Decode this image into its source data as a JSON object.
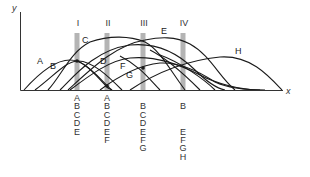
{
  "axes": {
    "y_label": "y",
    "x_label": "x"
  },
  "colors": {
    "curve": "#1a1a1a",
    "bar": "#b4b4b4",
    "axis": "#333333"
  },
  "sections": [
    {
      "label": "I",
      "x": 77,
      "species": [
        "A",
        "B",
        "C",
        "D",
        "E"
      ]
    },
    {
      "label": "II",
      "x": 107,
      "species": [
        "A",
        "B",
        "C",
        "D",
        "E",
        "F"
      ]
    },
    {
      "label": "III",
      "x": 143,
      "species": [
        "",
        "B",
        "C",
        "D",
        "E",
        "F",
        "G"
      ]
    },
    {
      "label": "IV",
      "x": 183,
      "species": [
        "",
        "B",
        "",
        "",
        "E",
        "F",
        "G",
        "H"
      ]
    }
  ],
  "curve_labels": [
    {
      "text": "A",
      "x": 38,
      "y": 57
    },
    {
      "text": "B",
      "x": 51,
      "y": 61
    },
    {
      "text": "C",
      "x": 82,
      "y": 36
    },
    {
      "text": "D",
      "x": 100,
      "y": 58
    },
    {
      "text": "E",
      "x": 161,
      "y": 27
    },
    {
      "text": "F",
      "x": 120,
      "y": 62
    },
    {
      "text": "G",
      "x": 127,
      "y": 72
    },
    {
      "text": "H",
      "x": 236,
      "y": 47
    }
  ]
}
